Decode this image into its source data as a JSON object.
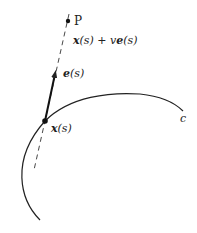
{
  "diagram": {
    "curve_label": "c",
    "point_P_label": "P",
    "line_label": {
      "x": "x",
      "s1": "(s)",
      "plus": " + ",
      "v": "v",
      "e": "e",
      "s2": "(s)"
    },
    "vector_label": {
      "e": "e",
      "s": "(s)"
    },
    "base_point_label": {
      "x": "x",
      "s": "(s)"
    },
    "colors": {
      "stroke": "#222222",
      "background": "#ffffff"
    }
  }
}
